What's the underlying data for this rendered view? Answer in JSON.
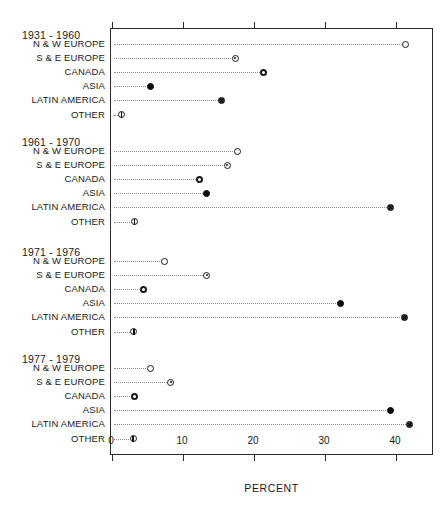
{
  "chart_data": {
    "type": "scatter",
    "title": "",
    "xlabel": "PERCENT",
    "ylabel": "",
    "xlim": [
      0,
      45.3
    ],
    "xticks": [
      0,
      10,
      20,
      30,
      40
    ],
    "xtick_labels": [
      "0",
      "10",
      "20",
      "30",
      "40"
    ],
    "grid": false,
    "legend_position": "none",
    "categories": [
      "N & W EUROPE",
      "S & E EUROPE",
      "CANADA",
      "ASIA",
      "LATIN AMERICA",
      "OTHER"
    ],
    "marker_styles": [
      "open-circle",
      "dotted-circle",
      "ring-circle",
      "filled-circle",
      "crossed-circle",
      "barred-circle"
    ],
    "groups": [
      {
        "label": "1931 - 1960",
        "values": [
          41.5,
          17.5,
          21.5,
          5.5,
          15.6,
          1.5
        ]
      },
      {
        "label": "1961 - 1970",
        "values": [
          17.8,
          16.4,
          12.5,
          13.5,
          39.4,
          3.3
        ]
      },
      {
        "label": "1971 - 1976",
        "values": [
          7.5,
          13.5,
          4.6,
          32.3,
          41.3,
          3.2
        ]
      },
      {
        "label": "1977 - 1979",
        "values": [
          5.5,
          8.4,
          3.3,
          39.3,
          42.1,
          3.1
        ]
      }
    ]
  },
  "axis": {
    "percent_label": "PERCENT"
  },
  "colors": {
    "frame": "#2b2b2b",
    "marker": "#1a1a1a",
    "leader": "#8a8a8a",
    "text": "#1a1a1a",
    "background": "#ffffff"
  }
}
